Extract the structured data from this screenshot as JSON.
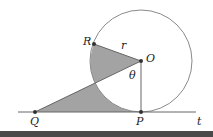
{
  "diagram": {
    "labels": {
      "R": "R",
      "O": "O",
      "r": "r",
      "theta": "θ",
      "Q": "Q",
      "P": "P",
      "t": "t"
    },
    "points": {
      "O": [
        141,
        61
      ],
      "R": [
        94,
        44
      ],
      "P": [
        141,
        112
      ],
      "Q": [
        35,
        112
      ]
    },
    "radius": 51,
    "colors": {
      "shade": "#a3a3a3",
      "stroke": "#555555",
      "circle": "#8a8a8a"
    }
  }
}
